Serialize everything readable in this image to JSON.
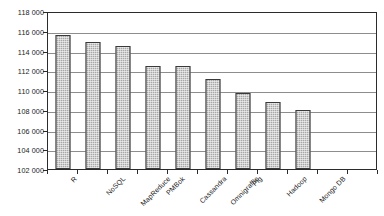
{
  "chart_data": {
    "type": "bar",
    "title": "",
    "subtitle": "",
    "xlabel": "",
    "ylabel": "",
    "categories": [
      "R",
      "NoSQL",
      "MapReduce",
      "PMBok",
      "Cassandra",
      "Omnigraffle",
      "Pig",
      "Hadoop",
      "Mongo DB"
    ],
    "values": [
      115600,
      114850,
      114450,
      112400,
      112450,
      111100,
      109650,
      108750,
      107950
    ],
    "series": [
      {
        "name": "",
        "values": [
          115600,
          114850,
          114450,
          112400,
          112450,
          111100,
          109650,
          108750,
          107950
        ]
      }
    ],
    "ylim": [
      102000,
      118000
    ],
    "ytick_values": [
      102000,
      104000,
      106000,
      108000,
      110000,
      112000,
      114000,
      116000,
      118000
    ],
    "ytick_labels": [
      "102 000",
      "104 000",
      "106 000",
      "108 000",
      "110 000",
      "112 000",
      "114 000",
      "116 000",
      "118 000"
    ],
    "grid": "horizontal",
    "legend": "none",
    "bar_fill_color": "#a8a8a8",
    "bar_border_color": "#3a3a3a",
    "gridline_color": "#8d8d8d",
    "frame_color": "#2b2b2b",
    "background_color": "#ffffff",
    "text_color": "#1a1a1a",
    "xtick_label_rotation": -45,
    "empty_slots_after_last_bar": 2,
    "annotations": []
  }
}
